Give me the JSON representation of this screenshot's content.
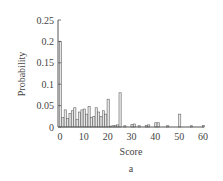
{
  "chart_data": {
    "type": "bar",
    "title": "",
    "panel_label": "a",
    "xlabel": "Score",
    "ylabel": "Probability",
    "xlim": [
      0,
      60
    ],
    "ylim": [
      0,
      0.25
    ],
    "xticks": [
      "0",
      "10",
      "20",
      "30",
      "40",
      "50",
      "60"
    ],
    "yticks": [
      "0",
      "0.05",
      "0.1",
      "0.15",
      "0.2",
      "0.25"
    ],
    "grid": false,
    "legend": null,
    "x": [
      0,
      1,
      2,
      3,
      4,
      5,
      6,
      7,
      8,
      9,
      10,
      11,
      12,
      13,
      14,
      15,
      16,
      17,
      18,
      19,
      20,
      21,
      22,
      23,
      24,
      25,
      27,
      30,
      31,
      33,
      36,
      37,
      40,
      41,
      45,
      50,
      55,
      60
    ],
    "values": [
      0.2,
      0.022,
      0.04,
      0.02,
      0.032,
      0.038,
      0.045,
      0.018,
      0.035,
      0.04,
      0.042,
      0.03,
      0.048,
      0.022,
      0.025,
      0.045,
      0.035,
      0.025,
      0.038,
      0.03,
      0.065,
      0.002,
      0.003,
      0.004,
      0.005,
      0.08,
      0.003,
      0.006,
      0.007,
      0.003,
      0.004,
      0.005,
      0.01,
      0.01,
      0.003,
      0.03,
      0.003,
      0.004
    ]
  },
  "labels": {
    "xlabel": "Score",
    "ylabel": "Probability",
    "panel": "a"
  }
}
